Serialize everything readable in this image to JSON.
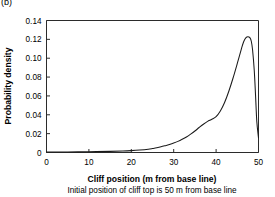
{
  "panel": {
    "label": "(b)"
  },
  "chart_data": {
    "type": "line",
    "title": "",
    "xlabel": "Cliff position (m from base line)",
    "xlabel_note": "Initial position of cliff top is 50 m from base line",
    "ylabel": "Probability density",
    "xlim": [
      0,
      50
    ],
    "ylim": [
      0,
      0.14
    ],
    "xticks": [
      0,
      10,
      20,
      30,
      40,
      50
    ],
    "yticks": [
      0,
      0.02,
      0.04,
      0.06,
      0.08,
      0.1,
      0.12,
      0.14
    ],
    "xtick_labels": [
      "0",
      "10",
      "20",
      "30",
      "40",
      "50"
    ],
    "ytick_labels": [
      "0",
      "0.02",
      "0.04",
      "0.06",
      "0.08",
      "0.10",
      "0.12",
      "0.14"
    ],
    "grid": false,
    "legend": null,
    "series": [
      {
        "name": "Probability density of cliff position",
        "color": "#1a1a1a",
        "x": [
          0,
          5,
          10,
          15,
          18,
          20,
          22,
          24,
          25,
          26,
          27,
          28,
          29,
          30,
          31,
          32,
          33,
          34,
          35,
          36,
          37,
          38,
          39,
          40,
          41,
          42,
          43,
          44,
          45,
          46,
          46.5,
          47,
          47.5,
          48,
          48.3,
          48.6,
          49,
          49.3,
          49.6,
          50
        ],
        "y": [
          0.0005,
          0.0006,
          0.0008,
          0.0012,
          0.0016,
          0.002,
          0.0026,
          0.0035,
          0.0042,
          0.005,
          0.006,
          0.0072,
          0.0085,
          0.01,
          0.0118,
          0.014,
          0.0165,
          0.0195,
          0.0228,
          0.0265,
          0.03,
          0.033,
          0.0352,
          0.038,
          0.044,
          0.053,
          0.065,
          0.079,
          0.0945,
          0.1105,
          0.1175,
          0.1215,
          0.1228,
          0.1215,
          0.118,
          0.109,
          0.087,
          0.061,
          0.033,
          0.0155
        ]
      }
    ]
  }
}
